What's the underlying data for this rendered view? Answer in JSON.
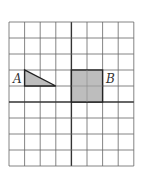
{
  "grid": {
    "cols": 8,
    "rows": 9,
    "x0": 9,
    "y0": 22,
    "cell_w": 15.6,
    "cell_h": 16,
    "line_color": "#555555",
    "thick_col": 4,
    "thick_row": 6
  },
  "shapes": {
    "A": {
      "label": "A",
      "type": "right-triangle",
      "vertices_grid": [
        [
          1,
          4
        ],
        [
          1,
          5
        ],
        [
          3,
          5
        ]
      ],
      "fill": "#bdbdbd"
    },
    "B": {
      "label": "B",
      "type": "rectangle",
      "from_grid": [
        4,
        4
      ],
      "to_grid": [
        6,
        6
      ],
      "fill": "#bdbdbd"
    }
  }
}
